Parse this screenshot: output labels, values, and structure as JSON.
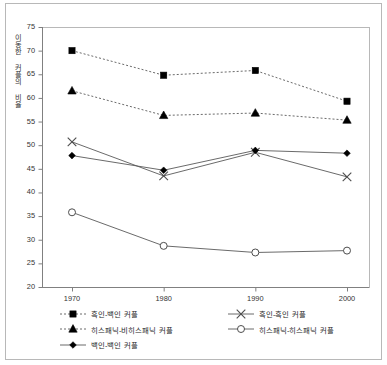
{
  "chart": {
    "ylabel": "이동한 커플의 비율",
    "xlabel": "",
    "title": ""
  },
  "axis": {
    "y_ticks": [
      "20",
      "25",
      "30",
      "35",
      "40",
      "45",
      "50",
      "55",
      "60",
      "65",
      "70",
      "75"
    ],
    "x_ticks": [
      "1970",
      "1980",
      "1990",
      "2000"
    ]
  },
  "legend": {
    "left": [
      {
        "label": "흑인-백인 커플",
        "marker": "square-marker",
        "line": "dashed"
      },
      {
        "label": "히스패닉-비히스패닉 커플",
        "marker": "triangle-marker",
        "line": "dashed"
      },
      {
        "label": "백인-백인 커플",
        "marker": "diamond-marker",
        "line": "solid"
      }
    ],
    "right": [
      {
        "label": "흑인-흑인 커플",
        "marker": "x-marker",
        "line": "solid"
      },
      {
        "label": "히스패닉-히스패닉 커플",
        "marker": "circle-marker",
        "line": "solid"
      }
    ]
  },
  "colors": {
    "line": "#595959",
    "marker": "#000000",
    "frame": "#b8b8b8",
    "axis": "#808080",
    "text": "#262626"
  },
  "chart_data": {
    "type": "line",
    "title": "",
    "xlabel": "",
    "ylabel": "이동한 커플의 비율",
    "x": [
      1970,
      1980,
      1990,
      2000
    ],
    "categories": [
      "1970",
      "1980",
      "1990",
      "2000"
    ],
    "ylim": [
      20,
      75
    ],
    "ytick_step": 5,
    "grid": false,
    "legend_position": "bottom",
    "series": [
      {
        "name": "흑인-백인 커플",
        "marker": "square",
        "linestyle": "dashed",
        "values": [
          70.0,
          64.8,
          65.8,
          59.3
        ]
      },
      {
        "name": "히스패닉-비히스패닉 커플",
        "marker": "triangle",
        "linestyle": "dashed",
        "values": [
          61.5,
          56.3,
          56.8,
          55.3
        ]
      },
      {
        "name": "흑인-흑인 커플",
        "marker": "x",
        "linestyle": "solid",
        "values": [
          50.7,
          43.5,
          48.5,
          43.3
        ]
      },
      {
        "name": "백인-백인 커플",
        "marker": "diamond",
        "linestyle": "solid",
        "values": [
          47.8,
          44.7,
          48.9,
          48.3
        ]
      },
      {
        "name": "히스패닉-히스패닉 커플",
        "marker": "circle",
        "linestyle": "solid",
        "values": [
          35.8,
          28.7,
          27.3,
          27.7
        ]
      }
    ]
  }
}
